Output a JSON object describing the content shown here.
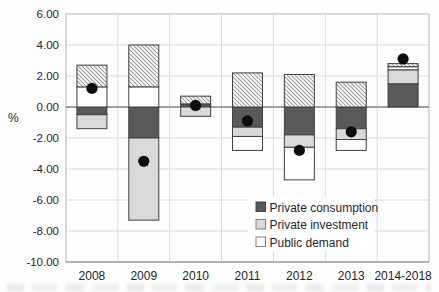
{
  "chart_data": {
    "type": "bar",
    "subtype": "stacked-contribution-bars-with-dot-markers",
    "title": "",
    "xlabel": "",
    "ylabel": "%",
    "ylim": [
      -10,
      6
    ],
    "ytick_step": 2,
    "yticks": [
      "6.00",
      "4.00",
      "2.00",
      "0.00",
      "-2.00",
      "-4.00",
      "-6.00",
      "-8.00",
      "-10.00"
    ],
    "grid": "both-light-gray",
    "categories": [
      "2008",
      "2009",
      "2010",
      "2011",
      "2012",
      "2013",
      "2014-2018"
    ],
    "series": [
      {
        "name": "Private consumption",
        "style": "solid-dark-gray",
        "color": "#595959",
        "in_legend": true,
        "values": [
          -0.5,
          -2.0,
          0.2,
          -1.3,
          -1.8,
          -1.4,
          1.5
        ]
      },
      {
        "name": "Private investment",
        "style": "solid-light-gray",
        "color": "#d9d9d9",
        "in_legend": true,
        "values": [
          -0.9,
          -5.3,
          -0.6,
          -0.6,
          -0.8,
          -0.7,
          0.9
        ]
      },
      {
        "name": "Public demand",
        "style": "white",
        "color": "#ffffff",
        "in_legend": true,
        "values": [
          1.3,
          1.3,
          0.0,
          -0.9,
          -2.1,
          -0.7,
          0.2
        ]
      },
      {
        "name": "",
        "style": "diagonal-hatch",
        "color": "hatch",
        "in_legend": false,
        "values": [
          1.4,
          2.7,
          0.5,
          2.2,
          2.1,
          1.6,
          0.2
        ]
      }
    ],
    "dot_series": {
      "style": "black-dot",
      "color": "#0d0d0d",
      "values": [
        1.2,
        -3.5,
        0.1,
        -0.9,
        -2.8,
        -1.6,
        3.1
      ]
    },
    "legend": {
      "position": "inside-bottom-right",
      "entries": [
        "Private consumption",
        "Private investment",
        "Public demand"
      ]
    }
  },
  "colors": {
    "grid": "#d9d9d9",
    "zero_line": "#595959",
    "plot_border": "#c8c8c8",
    "bottom_axis": "#8c8c8c",
    "bar_border": "#404040",
    "hatch_line": "#9c9c9c",
    "dark_series": "#595959",
    "light_series": "#d9d9d9",
    "text": "#262626"
  }
}
